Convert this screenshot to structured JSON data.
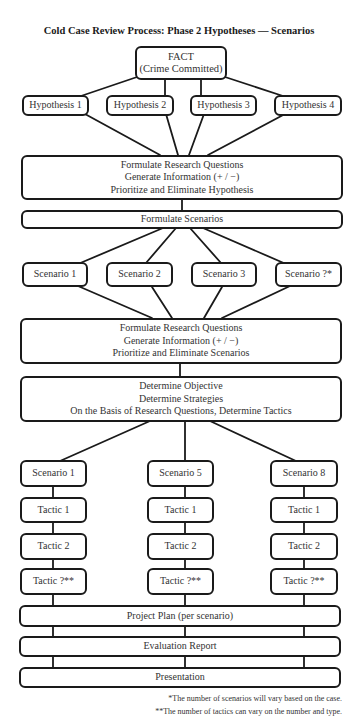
{
  "title": "Cold Case Review Process: Phase 2 Hypotheses — Scenarios",
  "fact": {
    "lines": [
      "FACT",
      "(Crime Committed)"
    ]
  },
  "hypotheses": [
    {
      "label": "Hypothesis 1"
    },
    {
      "label": "Hypothesis 2"
    },
    {
      "label": "Hypothesis 3"
    },
    {
      "label": "Hypothesis 4"
    }
  ],
  "hypothesis_review": {
    "lines": [
      "Formulate Research Questions",
      "Generate Information (+ / −)",
      "Prioritize and Eliminate Hypothesis"
    ]
  },
  "formulate_scenarios": {
    "label": "Formulate Scenarios"
  },
  "scenarios": [
    {
      "label": "Scenario 1"
    },
    {
      "label": "Scenario 2"
    },
    {
      "label": "Scenario 3"
    },
    {
      "label": "Scenario ?*"
    }
  ],
  "scenario_review": {
    "lines": [
      "Formulate Research Questions",
      "Generate Information (+ / −)",
      "Prioritize and Eliminate Scenarios"
    ]
  },
  "objective": {
    "lines": [
      "Determine Objective",
      "Determine Strategies",
      "On the Basis of Research Questions, Determine Tactics"
    ]
  },
  "columns": [
    {
      "scenario": "Scenario 1",
      "tactics": [
        "Tactic 1",
        "Tactic 2",
        "Tactic ?**"
      ]
    },
    {
      "scenario": "Scenario 5",
      "tactics": [
        "Tactic 1",
        "Tactic 2",
        "Tactic ?**"
      ]
    },
    {
      "scenario": "Scenario 8",
      "tactics": [
        "Tactic 1",
        "Tactic 2",
        "Tactic ?**"
      ]
    }
  ],
  "project_plan": {
    "label": "Project Plan (per scenario)"
  },
  "evaluation_report": {
    "label": "Evaluation Report"
  },
  "presentation": {
    "label": "Presentation"
  },
  "footnotes": [
    "*The number of scenarios will vary based on the case.",
    "**The number of tactics can vary on the number and type."
  ]
}
